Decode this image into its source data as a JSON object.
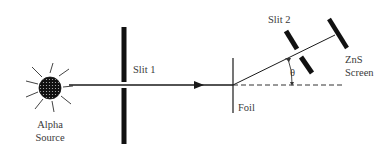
{
  "diagram": {
    "labels": {
      "alpha_source_line1": "Alpha",
      "alpha_source_line2": "Source",
      "slit1": "Slit 1",
      "slit2": "Slit 2",
      "foil": "Foil",
      "screen_line1": "ZnS",
      "screen_line2": "Screen",
      "angle": "θ"
    },
    "colors": {
      "ink": "#1a1a1a",
      "text": "#3a3a3a",
      "background": "#ffffff"
    }
  }
}
